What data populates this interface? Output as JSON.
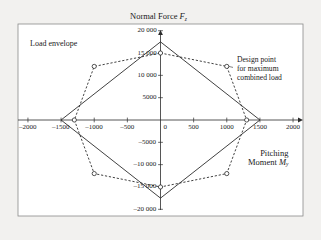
{
  "figure": {
    "background_color": "#f2f1ef",
    "plot_background_color": "#ffffff",
    "line_color": "#2b2b2b",
    "frame_color": "#8a8a8a"
  },
  "title": {
    "text_main": "Normal Force ",
    "symbol": "F",
    "subscript": "z"
  },
  "xaxis_title": {
    "line1": "Pitching",
    "line2_main": "Moment ",
    "line2_symbol": "M",
    "line2_subscript": "y"
  },
  "annotations": {
    "load_envelope": "Load envelope",
    "design_point_line1": "Design point",
    "design_point_line2": "for maximum",
    "design_point_line3": "combined load"
  },
  "xticks": [
    {
      "label": "–2000",
      "value": -2000
    },
    {
      "label": "–1500",
      "value": -1500
    },
    {
      "label": "–1000",
      "value": -1000
    },
    {
      "label": "–500",
      "value": -500
    },
    {
      "label": "0",
      "value": 0
    },
    {
      "label": "500",
      "value": 500
    },
    {
      "label": "1000",
      "value": 1000
    },
    {
      "label": "1500",
      "value": 1500
    },
    {
      "label": "2000",
      "value": 2000
    }
  ],
  "yticks": [
    {
      "label": "20 000",
      "value": 20000
    },
    {
      "label": "15 000",
      "value": 15000
    },
    {
      "label": "10 000",
      "value": 10000
    },
    {
      "label": "5000",
      "value": 5000
    },
    {
      "label": "–5000",
      "value": -5000
    },
    {
      "label": "–10 000",
      "value": -10000
    },
    {
      "label": "–15 000",
      "value": -15000
    },
    {
      "label": "–20 000",
      "value": -20000
    }
  ],
  "chart_data": {
    "type": "line",
    "title": "Normal Force Fz",
    "xlabel": "Pitching Moment My",
    "ylabel": "Normal Force Fz",
    "xlim": [
      -2150,
      2150
    ],
    "ylim": [
      -21500,
      21500
    ],
    "grid": false,
    "legend": "none",
    "series": [
      {
        "name": "Design load diamond",
        "style": "solid",
        "closed": true,
        "markers": false,
        "points": [
          {
            "x": 0,
            "y": 17500
          },
          {
            "x": 1500,
            "y": 0
          },
          {
            "x": 0,
            "y": -17500
          },
          {
            "x": -1500,
            "y": 0
          }
        ]
      },
      {
        "name": "Load envelope octagon",
        "style": "dashed",
        "closed": true,
        "markers": true,
        "points": [
          {
            "x": 0,
            "y": 15000
          },
          {
            "x": 1000,
            "y": 12000
          },
          {
            "x": 1300,
            "y": 0
          },
          {
            "x": 1000,
            "y": -12000
          },
          {
            "x": 0,
            "y": -15000
          },
          {
            "x": -1000,
            "y": -12000
          },
          {
            "x": -1300,
            "y": 0
          },
          {
            "x": -1000,
            "y": 12000
          }
        ]
      }
    ],
    "annotated_points": [
      {
        "label": "Design point for maximum combined load",
        "x": 1000,
        "y": 12000
      }
    ]
  }
}
